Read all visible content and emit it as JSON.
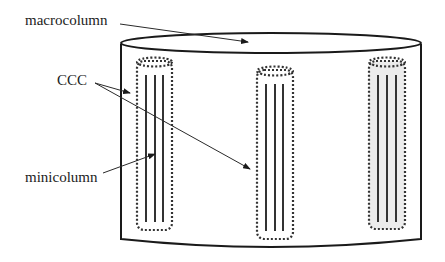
{
  "diagram": {
    "labels": {
      "macrocolumn": "macrocolumn",
      "ccc": "CCC",
      "minicolumn": "minicolumn"
    },
    "colors": {
      "line": "#1a1a1a",
      "text": "#222222",
      "shaded_column_fill": "#ececec",
      "background": "#ffffff"
    },
    "minicolumns": [
      {
        "id": "left",
        "shaded": false,
        "fiber_count": 3
      },
      {
        "id": "center",
        "shaded": false,
        "fiber_count": 3
      },
      {
        "id": "right",
        "shaded": true,
        "fiber_count": 3
      }
    ]
  }
}
